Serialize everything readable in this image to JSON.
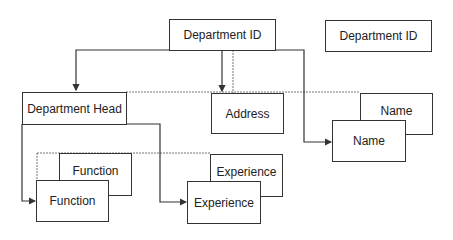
{
  "diagram": {
    "nodes": {
      "root": "Department ID",
      "root_standalone": "Department ID",
      "head": "Department Head",
      "address": "Address",
      "name_back": "Name",
      "name_front": "Name",
      "function_back": "Function",
      "function_front": "Function",
      "experience_back": "Experience",
      "experience_front": "Experience"
    },
    "edges": [
      {
        "from": "root",
        "to": "head",
        "style": "solid-arrow"
      },
      {
        "from": "root",
        "to": "address",
        "style": "solid-arrow"
      },
      {
        "from": "root",
        "to": "name_front",
        "style": "solid-arrow"
      },
      {
        "from": "head",
        "to": "function_front",
        "style": "solid-arrow"
      },
      {
        "from": "head",
        "to": "experience_front",
        "style": "solid-arrow"
      },
      {
        "from": "root",
        "to": "address",
        "style": "dotted"
      },
      {
        "from": "head",
        "to": "name_back",
        "style": "dotted"
      },
      {
        "from": "function_front",
        "to": "experience_back",
        "style": "dotted"
      }
    ]
  }
}
